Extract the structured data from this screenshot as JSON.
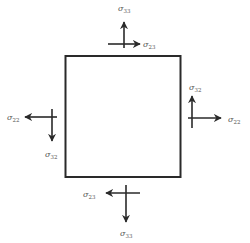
{
  "diagram": {
    "type": "stress-element",
    "colors": {
      "line": "#2a2a2a",
      "label": "#555555",
      "background": "#ffffff"
    },
    "element": {
      "shape": "square",
      "x": 65.5,
      "y": 56,
      "width": 115,
      "height": 121
    },
    "faces": {
      "top": {
        "normal_stress": {
          "symbol": "σ",
          "subscript": "33",
          "direction": "up"
        },
        "shear_stress": {
          "symbol": "σ",
          "subscript": "23",
          "direction": "right"
        }
      },
      "bottom": {
        "normal_stress": {
          "symbol": "σ",
          "subscript": "33",
          "direction": "down"
        },
        "shear_stress": {
          "symbol": "σ",
          "subscript": "23",
          "direction": "left"
        }
      },
      "left": {
        "normal_stress": {
          "symbol": "σ",
          "subscript": "22",
          "direction": "left"
        },
        "shear_stress": {
          "symbol": "σ",
          "subscript": "32",
          "direction": "down"
        }
      },
      "right": {
        "normal_stress": {
          "symbol": "σ",
          "subscript": "22",
          "direction": "right"
        },
        "shear_stress": {
          "symbol": "σ",
          "subscript": "32",
          "direction": "up"
        }
      }
    }
  }
}
